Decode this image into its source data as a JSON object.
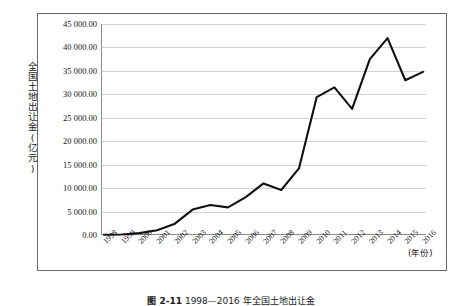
{
  "chart_data": {
    "type": "line",
    "title": "",
    "xlabel": "(年份)",
    "ylabel": "全国土地出让金(亿元)",
    "x": [
      1998,
      1999,
      2000,
      2001,
      2002,
      2003,
      2004,
      2005,
      2006,
      2007,
      2008,
      2009,
      2010,
      2011,
      2012,
      2013,
      2014,
      2015,
      2016
    ],
    "categories": [
      "1998",
      "1999",
      "2000",
      "2001",
      "2002",
      "2003",
      "2004",
      "2005",
      "2006",
      "2007",
      "2008",
      "2009",
      "2010",
      "2011",
      "2012",
      "2013",
      "2014",
      "2015",
      "2016"
    ],
    "values": [
      69,
      100,
      400,
      1000,
      2417,
      5421,
      6412,
      5884,
      8078,
      11000,
      9600,
      14200,
      29397,
      31500,
      26900,
      37500,
      42000,
      33000,
      34800
    ],
    "series": [
      {
        "name": "全国土地出让金",
        "values": [
          69,
          100,
          400,
          1000,
          2417,
          5421,
          6412,
          5884,
          8078,
          11000,
          9600,
          14200,
          29397,
          31500,
          26900,
          37500,
          42000,
          33000,
          34800
        ]
      }
    ],
    "ylim": [
      0,
      45000
    ],
    "ytick_step": 5000,
    "ytick_labels": [
      "45 000.00",
      "40 000.00",
      "35 000.00",
      "30 000.00",
      "25 000.00",
      "20 000.00",
      "15 000.00",
      "10 000.00",
      "5 000.00",
      "0.00"
    ],
    "ytick_values": [
      45000,
      40000,
      35000,
      30000,
      25000,
      20000,
      15000,
      10000,
      5000,
      0
    ],
    "grid": true,
    "legend": false,
    "line_color": "#111111",
    "grid_color": "#d2d2d2"
  },
  "figure": {
    "caption_number": "图 2-11",
    "caption_text": "1998—2016 年全国土地出让金",
    "unit_note": "(年份)"
  }
}
